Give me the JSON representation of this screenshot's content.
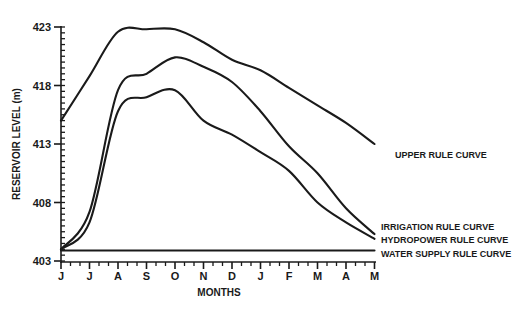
{
  "chart_data": {
    "type": "line",
    "title": "",
    "xlabel": "MONTHS",
    "ylabel": "RESERVOIR LEVEL (m)",
    "categories": [
      "J",
      "J",
      "A",
      "S",
      "O",
      "N",
      "D",
      "J",
      "F",
      "M",
      "A",
      "M"
    ],
    "x_tick_labels": [
      "J",
      "J",
      "A",
      "S",
      "O",
      "N",
      "D",
      "J",
      "F",
      "M",
      "A",
      "M"
    ],
    "y_tick_labels": [
      "403",
      "408",
      "413",
      "418",
      "423"
    ],
    "ylim": [
      403,
      423
    ],
    "y_minor_tick_step": 0.5,
    "x_minor_ticks_per_month": 3,
    "grid": false,
    "legend_position": "inline-right",
    "series": [
      {
        "name": "UPPER RULE CURVE",
        "values": [
          415.0,
          418.8,
          422.6,
          422.8,
          422.8,
          421.7,
          420.2,
          419.3,
          417.8,
          416.3,
          414.8,
          413.0
        ]
      },
      {
        "name": "IRRIGATION RULE CURVE",
        "values": [
          404.0,
          407.2,
          417.6,
          419.0,
          420.4,
          419.6,
          418.3,
          415.8,
          412.8,
          410.5,
          407.5,
          405.3
        ]
      },
      {
        "name": "HYDROPOWER RULE CURVE",
        "values": [
          404.0,
          406.3,
          415.8,
          417.0,
          417.6,
          415.0,
          413.8,
          412.3,
          410.7,
          408.0,
          406.3,
          404.9
        ]
      },
      {
        "name": "WATER SUPPLY RULE CURVE",
        "values": [
          403.9,
          403.9,
          403.9,
          403.9,
          403.9,
          403.9,
          403.9,
          403.9,
          403.9,
          403.9,
          403.9,
          403.9
        ]
      }
    ],
    "line_color": "#1a1a1a"
  },
  "labels": {
    "ylabel": "RESERVOIR LEVEL (m)",
    "xlabel": "MONTHS",
    "upper": "UPPER RULE CURVE",
    "irrigation": "IRRIGATION RULE CURVE",
    "hydropower": "HYDROPOWER RULE CURVE",
    "water_supply": "WATER SUPPLY RULE CURVE"
  }
}
